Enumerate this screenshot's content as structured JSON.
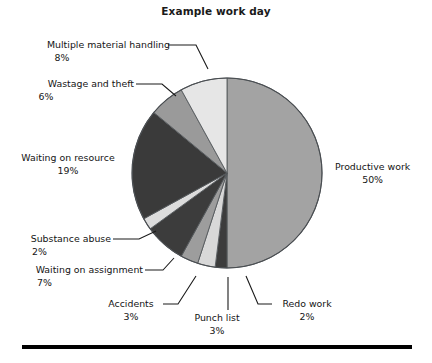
{
  "chart_data": {
    "type": "pie",
    "title": "Example work day",
    "xlabel": "",
    "ylabel": "",
    "legend_position": "callout-labels",
    "grid": false,
    "value_suffix": "%",
    "total": 100,
    "categories": [
      "Productive work",
      "Redo work",
      "Punch list",
      "Accidents",
      "Waiting on assignment",
      "Substance abuse",
      "Waiting on resource",
      "Wastage and theft",
      "Multiple material handling"
    ],
    "values": [
      50,
      2,
      3,
      3,
      7,
      2,
      19,
      6,
      8
    ],
    "labels": [
      "50%",
      "2%",
      "3%",
      "3%",
      "7%",
      "2%",
      "19%",
      "6%",
      "8%"
    ],
    "colors": [
      "#a3a3a3",
      "#3c3c3c",
      "#d8d8d8",
      "#9d9d9d",
      "#3c3c3c",
      "#dcdcdc",
      "#3a3a3a",
      "#9a9a9a",
      "#e6e6e6"
    ],
    "slices": [
      {
        "name": "Productive work",
        "value": 50,
        "label": "50%",
        "color": "#a3a3a3"
      },
      {
        "name": "Redo work",
        "value": 2,
        "label": "2%",
        "color": "#3c3c3c"
      },
      {
        "name": "Punch list",
        "value": 3,
        "label": "3%",
        "color": "#d8d8d8"
      },
      {
        "name": "Accidents",
        "value": 3,
        "label": "3%",
        "color": "#9d9d9d"
      },
      {
        "name": "Waiting on assignment",
        "value": 7,
        "label": "7%",
        "color": "#3c3c3c"
      },
      {
        "name": "Substance abuse",
        "value": 2,
        "label": "2%",
        "color": "#dcdcdc"
      },
      {
        "name": "Waiting on resource",
        "value": 19,
        "label": "19%",
        "color": "#3a3a3a"
      },
      {
        "name": "Wastage and theft",
        "value": 6,
        "label": "6%",
        "color": "#9a9a9a"
      },
      {
        "name": "Multiple material handling",
        "value": 8,
        "label": "8%",
        "color": "#e6e6e6"
      }
    ]
  },
  "callouts": {
    "productive_work": {
      "name": "Productive work",
      "pct": "50%"
    },
    "redo_work": {
      "name": "Redo work",
      "pct": "2%"
    },
    "punch_list": {
      "name": "Punch list",
      "pct": "3%"
    },
    "accidents": {
      "name": "Accidents",
      "pct": "3%"
    },
    "waiting_on_assignment": {
      "name": "Waiting on assignment",
      "pct": "7%"
    },
    "substance_abuse": {
      "name": "Substance abuse",
      "pct": "2%"
    },
    "waiting_on_resource": {
      "name": "Waiting on resource",
      "pct": "19%"
    },
    "wastage_and_theft": {
      "name": "Wastage and theft",
      "pct": "6%"
    },
    "multiple_material_handling": {
      "name": "Multiple material handling",
      "pct": "8%"
    }
  }
}
